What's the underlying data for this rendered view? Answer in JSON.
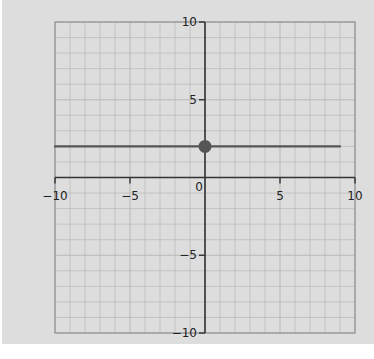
{
  "chart_data": {
    "type": "line",
    "title": "",
    "xlabel": "",
    "ylabel": "",
    "xlim": [
      -10,
      10
    ],
    "ylim": [
      -10,
      10
    ],
    "grid": true,
    "x_ticks": [
      -10,
      -5,
      0,
      5,
      10
    ],
    "y_ticks": [
      -10,
      -5,
      5,
      10
    ],
    "x_tick_labels": [
      "-10",
      "-5",
      "0",
      "5",
      "10"
    ],
    "y_tick_labels": [
      "-10",
      "-5",
      "5",
      "10"
    ],
    "series": [
      {
        "name": "horizontal line",
        "equation": "y = 2",
        "x": [
          -10,
          10
        ],
        "y": [
          2,
          2
        ],
        "color": "#555555"
      }
    ],
    "points": [
      {
        "x": 0,
        "y": 2,
        "filled": true,
        "color": "#555555"
      }
    ]
  },
  "colors": {
    "paper": "#dddddd",
    "grid": "#b8b8b8",
    "axis": "#333333",
    "line": "#555555"
  }
}
